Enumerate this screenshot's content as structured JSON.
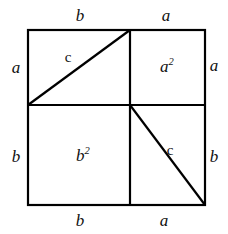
{
  "figure": {
    "type": "geometric-diagram",
    "stroke_color": "#000000",
    "background_color": "#ffffff",
    "square": {
      "left": 28,
      "top": 30,
      "right": 205,
      "bottom": 205,
      "divider_x": 130,
      "divider_y": 105
    },
    "edge_labels": {
      "top_left": "b",
      "top_right": "a",
      "right_top": "a",
      "right_bottom": "b",
      "bottom_left": "b",
      "bottom_right": "a",
      "left_top": "a",
      "left_bottom": "b"
    },
    "area_labels": {
      "upper_right": "a",
      "upper_right_exp": "2",
      "lower_left": "b",
      "lower_left_exp": "2"
    },
    "hypotenuse_labels": {
      "upper": "c",
      "lower": "c"
    }
  }
}
